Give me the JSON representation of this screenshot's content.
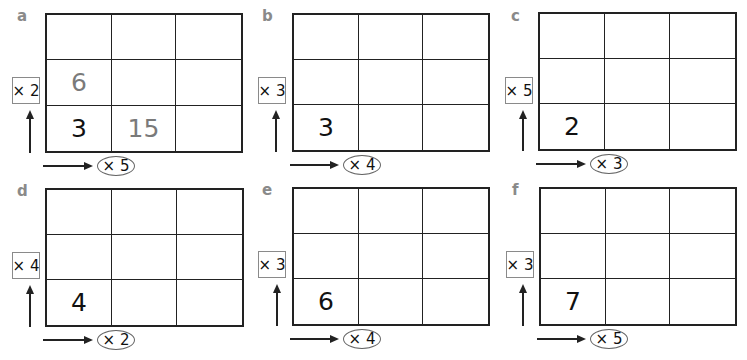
{
  "panels": [
    {
      "id": "a",
      "label": "a",
      "row_multiplier": "× 2",
      "col_multiplier": "× 5",
      "cells": [
        [
          "",
          "",
          ""
        ],
        [
          "6",
          "",
          ""
        ],
        [
          "3",
          "15",
          ""
        ]
      ],
      "hint_cells": [
        [
          1,
          0
        ],
        [
          2,
          1
        ]
      ]
    },
    {
      "id": "b",
      "label": "b",
      "row_multiplier": "× 3",
      "col_multiplier": "× 4",
      "cells": [
        [
          "",
          "",
          ""
        ],
        [
          "",
          "",
          ""
        ],
        [
          "3",
          "",
          ""
        ]
      ],
      "hint_cells": []
    },
    {
      "id": "c",
      "label": "c",
      "row_multiplier": "× 5",
      "col_multiplier": "× 3",
      "cells": [
        [
          "",
          "",
          ""
        ],
        [
          "",
          "",
          ""
        ],
        [
          "2",
          "",
          ""
        ]
      ],
      "hint_cells": []
    },
    {
      "id": "d",
      "label": "d",
      "row_multiplier": "× 4",
      "col_multiplier": "× 2",
      "cells": [
        [
          "",
          "",
          ""
        ],
        [
          "",
          "",
          ""
        ],
        [
          "4",
          "",
          ""
        ]
      ],
      "hint_cells": []
    },
    {
      "id": "e",
      "label": "e",
      "row_multiplier": "× 3",
      "col_multiplier": "× 4",
      "cells": [
        [
          "",
          "",
          ""
        ],
        [
          "",
          "",
          ""
        ],
        [
          "6",
          "",
          ""
        ]
      ],
      "hint_cells": []
    },
    {
      "id": "f",
      "label": "f",
      "row_multiplier": "× 3",
      "col_multiplier": "× 5",
      "cells": [
        [
          "",
          "",
          ""
        ],
        [
          "",
          "",
          ""
        ],
        [
          "7",
          "",
          ""
        ]
      ],
      "hint_cells": []
    }
  ],
  "colors": {
    "grid_line": "#222222",
    "given_number": "#111111",
    "hint_number": "#7a7a7a",
    "panel_label": "#8a8a8a"
  }
}
